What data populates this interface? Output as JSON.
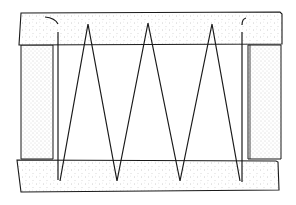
{
  "diagram": {
    "colors": {
      "line": "#1a1a1a",
      "fill": "#ffffff",
      "stipple": "#9a9a9a",
      "background": "#ffffff"
    },
    "frame": {
      "top_beam": {
        "x": 20,
        "y": 13,
        "w": 262,
        "h": 32
      },
      "bottom_beam": {
        "x": 17,
        "y": 159,
        "w": 262,
        "h": 32
      },
      "left_post": {
        "x": 21,
        "y": 45,
        "w": 34,
        "h": 114
      },
      "right_post": {
        "x": 248,
        "y": 45,
        "w": 33,
        "h": 114
      }
    },
    "lacing": {
      "points": [
        [
          60,
          79
        ],
        [
          88,
          24
        ],
        [
          117,
          79
        ],
        [
          148,
          23
        ],
        [
          180,
          80
        ],
        [
          212,
          24
        ],
        [
          240,
          79
        ]
      ],
      "vertical_cord_left": {
        "x": 58,
        "y1": 31,
        "y2": 81
      },
      "vertical_cord_right": {
        "x": 242,
        "y1": 32,
        "y2": 81
      }
    }
  }
}
